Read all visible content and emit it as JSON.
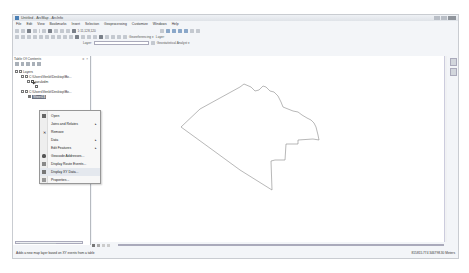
{
  "window": {
    "title": "Untitled - ArcMap - ArcInfo",
    "controls": [
      "minimize",
      "maximize",
      "close"
    ]
  },
  "menubar": [
    "File",
    "Edit",
    "View",
    "Bookmarks",
    "Insert",
    "Selection",
    "Geoprocessing",
    "Customize",
    "Windows",
    "Help"
  ],
  "toolbar": {
    "scale_value": "1:11,128,120",
    "georeferencing_label": "Georeferencing ▾",
    "layer_label": "Layer:",
    "layer_value": "",
    "geostatistical_label": "Geostatistical Analyst ▾"
  },
  "toc": {
    "title": "Table Of Contents",
    "pin": "⨯ ×",
    "tree": [
      {
        "label": "Layers",
        "level": 0,
        "type": "group"
      },
      {
        "label": "C:\\Users\\Venkt\\Desktop\\Bo...",
        "level": 1,
        "type": "folder"
      },
      {
        "label": "jaeulzdm",
        "level": 2,
        "type": "layer",
        "checked": true
      },
      {
        "label": "",
        "level": 3,
        "type": "symbol"
      },
      {
        "label": "C:\\Users\\Venkt\\Desktop\\Bo...",
        "level": 1,
        "type": "folder"
      },
      {
        "label": "Sheet1$",
        "level": 2,
        "type": "table",
        "selected": true
      }
    ]
  },
  "context_menu": {
    "items": [
      {
        "label": "Open",
        "icon": "table-icon",
        "submenu": false
      },
      {
        "label": "Joins and Relates",
        "icon": "",
        "submenu": true
      },
      {
        "label": "Remove",
        "icon": "remove-x-icon",
        "submenu": false
      },
      {
        "label": "Data",
        "icon": "",
        "submenu": true
      },
      {
        "label": "Edit Features",
        "icon": "",
        "submenu": true
      },
      {
        "label": "Geocode Addresses...",
        "icon": "globe-icon",
        "submenu": false
      },
      {
        "label": "Display Route Events...",
        "icon": "route-icon",
        "submenu": false
      },
      {
        "label": "Display XY Data...",
        "icon": "xy-data-icon",
        "submenu": false
      },
      {
        "label": "Properties...",
        "icon": "properties-icon",
        "submenu": false
      }
    ]
  },
  "map": {
    "polygon_color": "#888888",
    "polygon_points": "148,31 152,28 159,31 163,35 167,34 171,30 174,31 178,35 182,36 186,40 189,46 191,51 196,53 201,55 206,56 210,59 215,62 219,64 222,67 224,71 225,75 226,79 227,84 221,83 206,84 206,88 194,88 193,104 183,104 179,105 180,134 148,114 122,95 89,71 108,53 148,31"
  },
  "status": {
    "message": "Adds a new map layer based on XY events from a table",
    "coordinates": "815815.774  346798.30 Meters"
  },
  "colors": {
    "window_bg": "#f3f5f8",
    "selection": "#6b7280",
    "menu_bg": "#f7f7f7"
  }
}
